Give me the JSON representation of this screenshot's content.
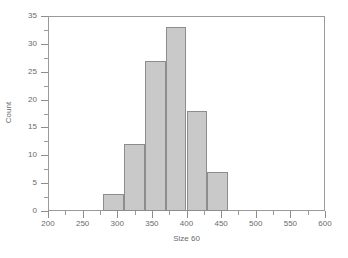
{
  "chart_data": {
    "type": "bar",
    "title": "",
    "subtitle": "",
    "xlabel": "Size 60",
    "ylabel": "Count",
    "xlim": [
      200,
      600
    ],
    "ylim": [
      0,
      35
    ],
    "grid": false,
    "legend": null,
    "bin_width": 30,
    "x_major_ticks": [
      200,
      250,
      300,
      350,
      400,
      450,
      500,
      550,
      600
    ],
    "x_minor_ticks": [
      225,
      275,
      325,
      375,
      425,
      475,
      525,
      575
    ],
    "x_tick_labels": [
      "200",
      "250",
      "300",
      "350",
      "400",
      "450",
      "500",
      "550",
      "600"
    ],
    "y_major_ticks": [
      0,
      5,
      10,
      15,
      20,
      25,
      30,
      35
    ],
    "y_minor_ticks": [
      2.5,
      7.5,
      12.5,
      17.5,
      22.5,
      27.5,
      32.5
    ],
    "y_tick_labels": [
      "0",
      "5",
      "10",
      "15",
      "20",
      "25",
      "30",
      "35"
    ],
    "bin_edges": [
      280,
      310,
      340,
      370,
      400,
      430,
      460
    ],
    "categories": [
      "280-310",
      "310-340",
      "340-370",
      "370-400",
      "400-430",
      "430-460"
    ],
    "values": [
      3,
      12,
      27,
      33,
      18,
      7
    ],
    "bar_fill_color": "#c9c9c9",
    "bar_edge_color": "#8d8d8d",
    "axis_color": "#9a9a9a",
    "text_color": "#6a6a6a",
    "background_color": "#ffffff"
  }
}
